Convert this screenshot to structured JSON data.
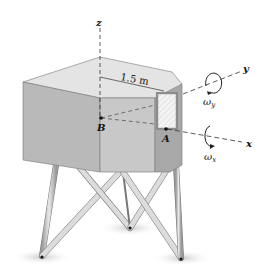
{
  "figure": {
    "axes": {
      "x_label": "x",
      "y_label": "y",
      "z_label": "z"
    },
    "points": {
      "A_label": "A",
      "B_label": "B"
    },
    "dimension": {
      "label": "1.5 m"
    },
    "angular_velocities": {
      "omega_x": "ω",
      "omega_x_sub": "x",
      "omega_y": "ω",
      "omega_y_sub": "y"
    },
    "colors": {
      "top_face": "#e4e4e4",
      "front_left_face": "#b9b9b9",
      "front_mid_face": "#c8c8c8",
      "right_face": "#a8a8a8",
      "window": "#f0f0f0",
      "leg": "#c4c4c4",
      "shadow": "#d6d6d6"
    }
  }
}
